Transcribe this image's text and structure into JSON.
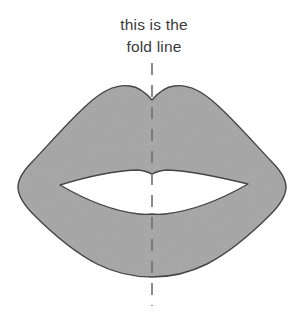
{
  "canvas": {
    "width": 308,
    "height": 314,
    "background_color": "#ffffff"
  },
  "caption": {
    "line1": "this is the",
    "line2": "fold line",
    "text_color": "#3a3a3a",
    "align": "center"
  },
  "artwork": {
    "name": "lips-template",
    "description": "symmetrical lips silhouette cut-out template",
    "fill_color": "#a9a9a9",
    "outline_color": "#454545",
    "mouth_opening_color": "#ffffff",
    "outline_width": 1.4
  },
  "fold_line": {
    "label": "vertical fold line",
    "color": "#6e6e6e",
    "width": 1.6,
    "dash": "12 10",
    "x": 152,
    "y_start": 63,
    "y_end": 306
  }
}
